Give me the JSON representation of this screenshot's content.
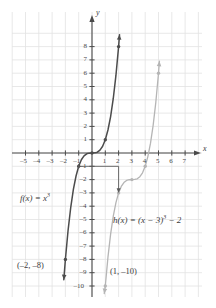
{
  "chart_data": {
    "type": "line",
    "title": "",
    "xlabel": "x",
    "ylabel": "y",
    "xlim": [
      -6,
      7.8
    ],
    "ylim": [
      -10.8,
      8.9
    ],
    "grid": true,
    "legend": "none",
    "x_ticks": [
      -5,
      -4,
      -3,
      -2,
      -1,
      1,
      2,
      3,
      4,
      5,
      6,
      7
    ],
    "x_tick_labels": [
      "–5",
      "–4",
      "–3",
      "–2",
      "–1",
      "1",
      "2",
      "3",
      "4",
      "5",
      "6",
      "7"
    ],
    "y_ticks": [
      8,
      7,
      6,
      5,
      4,
      3,
      2,
      1,
      -1,
      -2,
      -3,
      -4,
      -5,
      -6,
      -7,
      -8,
      -9,
      -10
    ],
    "y_tick_labels": [
      "8",
      "7",
      "6",
      "5",
      "4",
      "3",
      "2",
      "1",
      "–1",
      "–2",
      "–3",
      "–4",
      "–5",
      "–6",
      "–7",
      "–8",
      "–9",
      "–10"
    ],
    "series": [
      {
        "name": "f",
        "label": "f(x) = x³",
        "expression": "x^3",
        "color": "#4c4c4c",
        "x": [
          -2.12,
          -2.0,
          -1.8,
          -1.6,
          -1.4,
          -1.2,
          -1.0,
          -0.8,
          -0.6,
          -0.4,
          -0.2,
          0,
          0.2,
          0.4,
          0.6,
          0.8,
          1.0,
          1.2,
          1.4,
          1.6,
          1.8,
          2.0,
          2.07
        ],
        "y": [
          -9.53,
          -8.0,
          -5.83,
          -4.1,
          -2.74,
          -1.73,
          -1.0,
          -0.51,
          -0.22,
          -0.06,
          -0.01,
          0,
          0.01,
          0.06,
          0.22,
          0.51,
          1.0,
          1.73,
          2.74,
          4.1,
          5.83,
          8.0,
          8.9
        ],
        "marked_points": [
          {
            "x": -2,
            "y": -8,
            "label": "(–2, –8)"
          },
          {
            "x": -1,
            "y": -1,
            "label": ""
          },
          {
            "x": 0,
            "y": 0,
            "label": ""
          },
          {
            "x": 1,
            "y": 1,
            "label": ""
          },
          {
            "x": 2,
            "y": 8,
            "label": ""
          }
        ]
      },
      {
        "name": "h",
        "label": "h(x) = (x − 3)³ − 2",
        "expression": "(x-3)^3-2",
        "color": "#b5b5b5",
        "x": [
          0.92,
          1.0,
          1.2,
          1.4,
          1.6,
          1.8,
          2.0,
          2.2,
          2.4,
          2.6,
          2.8,
          3.0,
          3.2,
          3.4,
          3.6,
          3.8,
          4.0,
          4.2,
          4.4,
          4.6,
          4.8,
          5.0,
          5.07
        ],
        "y": [
          -10.57,
          -10.0,
          -7.83,
          -6.1,
          -4.74,
          -3.73,
          -3.0,
          -2.51,
          -2.22,
          -2.06,
          -2.01,
          -2.0,
          -1.99,
          -1.94,
          -1.78,
          -1.49,
          -1.0,
          -0.27,
          0.74,
          2.1,
          3.83,
          6.0,
          6.9
        ],
        "marked_points": [
          {
            "x": 1,
            "y": -10,
            "label": "(1, –10)"
          },
          {
            "x": 2,
            "y": -3,
            "label": ""
          },
          {
            "x": 3,
            "y": -2,
            "label": ""
          },
          {
            "x": 4,
            "y": -1,
            "label": ""
          },
          {
            "x": 5,
            "y": 6,
            "label": ""
          }
        ]
      }
    ],
    "annotations": [
      {
        "name": "translation-arrow",
        "from": {
          "x": -1,
          "y": -1
        },
        "corner": {
          "x": 2,
          "y": -1
        },
        "to": {
          "x": 2,
          "y": -3
        },
        "color": "#5a5a5a"
      }
    ],
    "point_labels": [
      {
        "name": "point-label-f",
        "text": "(–2, –8)"
      },
      {
        "name": "point-label-h",
        "text": "(1, –10)"
      }
    ]
  },
  "axes": {
    "x_axis_name": "x",
    "y_axis_name": "y"
  },
  "colors": {
    "grid": "#e2e2e2",
    "axis": "#4a4a4a",
    "curve_f": "#4c4c4c",
    "curve_h": "#b5b5b5",
    "text": "#3b3b3b"
  }
}
